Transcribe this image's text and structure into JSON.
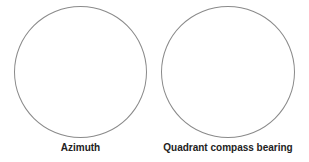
{
  "diagrams": [
    {
      "label": "Azimuth"
    },
    {
      "label": "Quadrant compass bearing"
    }
  ]
}
